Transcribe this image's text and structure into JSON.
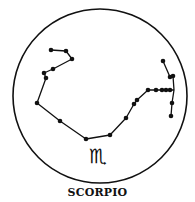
{
  "diagram": {
    "title": "SCORPIO",
    "symbol": "♏",
    "colors": {
      "ink": "#111111",
      "background": "#ffffff"
    },
    "frame": {
      "cx": 100,
      "cy": 96,
      "r": 87
    },
    "constellation": {
      "main_path": [
        [
          51,
          50
        ],
        [
          66,
          51
        ],
        [
          72,
          59
        ],
        [
          53,
          69
        ],
        [
          44,
          73
        ],
        [
          46,
          78
        ],
        [
          37,
          103
        ],
        [
          60,
          121
        ],
        [
          86,
          139
        ],
        [
          110,
          135
        ],
        [
          126,
          118
        ],
        [
          134,
          104
        ],
        [
          137,
          100
        ],
        [
          148,
          90
        ],
        [
          156,
          90
        ],
        [
          162,
          90
        ],
        [
          166,
          90
        ],
        [
          170,
          90
        ],
        [
          174,
          90
        ]
      ],
      "branch_path": [
        [
          163,
          61
        ],
        [
          170,
          77
        ],
        [
          173,
          76
        ],
        [
          174,
          90
        ],
        [
          172,
          103
        ],
        [
          171,
          116
        ]
      ],
      "stars": [
        [
          51,
          50
        ],
        [
          66,
          51
        ],
        [
          72,
          59
        ],
        [
          53,
          69
        ],
        [
          44,
          73
        ],
        [
          46,
          78
        ],
        [
          37,
          103
        ],
        [
          60,
          121
        ],
        [
          86,
          139
        ],
        [
          110,
          135
        ],
        [
          126,
          118
        ],
        [
          134,
          104
        ],
        [
          137,
          100
        ],
        [
          148,
          90
        ],
        [
          156,
          90
        ],
        [
          162,
          90
        ],
        [
          166,
          90
        ],
        [
          170,
          90
        ],
        [
          163,
          61
        ],
        [
          170,
          77
        ],
        [
          173,
          76
        ],
        [
          172,
          103
        ],
        [
          171,
          116
        ]
      ]
    }
  }
}
